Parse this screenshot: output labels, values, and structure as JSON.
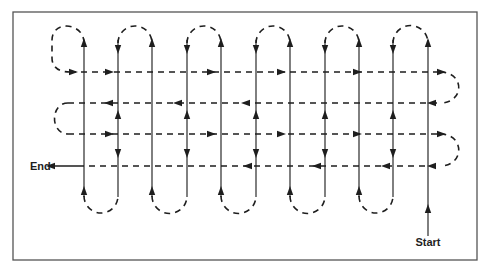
{
  "figure": {
    "labels": {
      "start": "Start",
      "end": "End"
    },
    "colors": {
      "line": "#1e1e1e",
      "frame": "#555555",
      "background": "#ffffff"
    },
    "vertical_passes_x": [
      84,
      118,
      152,
      187,
      221,
      256,
      290,
      325,
      359,
      393,
      428
    ],
    "horizontal_passes_y": [
      72,
      103,
      134,
      166
    ],
    "top_loops": [
      [
        118,
        152
      ],
      [
        187,
        221
      ],
      [
        256,
        290
      ],
      [
        325,
        359
      ],
      [
        393,
        428
      ]
    ],
    "bottom_loops": [
      [
        84,
        118
      ],
      [
        152,
        187
      ],
      [
        221,
        256
      ],
      [
        290,
        325
      ],
      [
        359,
        393
      ]
    ]
  }
}
